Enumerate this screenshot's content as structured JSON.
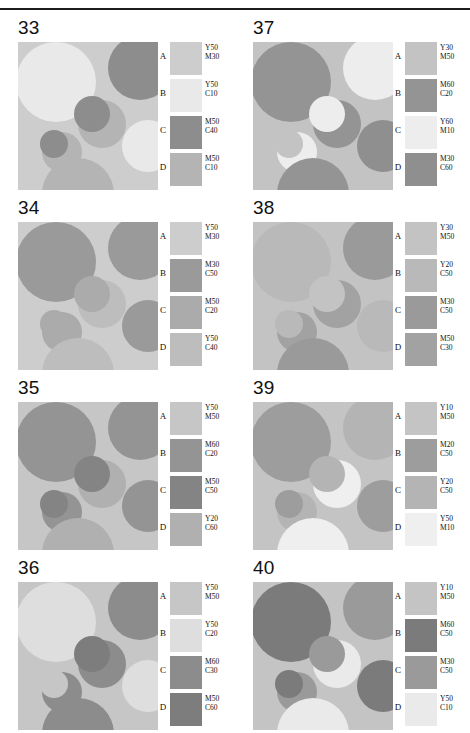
{
  "document": {
    "type": "color-specification-chart",
    "ink_notation": "CMY percentages (C=cyan, M=magenta, Y=yellow)",
    "swatch_letters": [
      "A",
      "B",
      "C",
      "D"
    ]
  },
  "panels": [
    {
      "number": "33",
      "swatches": [
        {
          "letter": "A",
          "line1": "Y50",
          "line2": "M30",
          "hex": "#cdcdcd"
        },
        {
          "letter": "B",
          "line1": "Y50",
          "line2": "C10",
          "hex": "#e9e9e9"
        },
        {
          "letter": "C",
          "line1": "M50",
          "line2": "C40",
          "hex": "#8d8d8d"
        },
        {
          "letter": "D",
          "line1": "M50",
          "line2": "C10",
          "hex": "#b4b4b4"
        }
      ],
      "art": {
        "background": "#cdcdcd",
        "circles": [
          {
            "cx": 38,
            "cy": 40,
            "r": 40,
            "fill": "#e9e9e9"
          },
          {
            "cx": 122,
            "cy": 26,
            "r": 32,
            "fill": "#8d8d8d"
          },
          {
            "cx": 84,
            "cy": 82,
            "r": 24,
            "fill": "#b4b4b4"
          },
          {
            "cx": 130,
            "cy": 104,
            "r": 26,
            "fill": "#e9e9e9"
          },
          {
            "cx": 44,
            "cy": 110,
            "r": 20,
            "fill": "#b4b4b4"
          },
          {
            "cx": 60,
            "cy": 152,
            "r": 36,
            "fill": "#b4b4b4"
          },
          {
            "cx": 74,
            "cy": 72,
            "r": 18,
            "fill": "#8d8d8d"
          },
          {
            "cx": 36,
            "cy": 102,
            "r": 14,
            "fill": "#8d8d8d"
          }
        ]
      }
    },
    {
      "number": "37",
      "swatches": [
        {
          "letter": "A",
          "line1": "Y30",
          "line2": "M50",
          "hex": "#c3c3c3"
        },
        {
          "letter": "B",
          "line1": "M60",
          "line2": "C20",
          "hex": "#949494"
        },
        {
          "letter": "C",
          "line1": "Y60",
          "line2": "M10",
          "hex": "#ededed"
        },
        {
          "letter": "D",
          "line1": "M30",
          "line2": "C60",
          "hex": "#8f8f8f"
        }
      ],
      "art": {
        "background": "#c3c3c3",
        "circles": [
          {
            "cx": 38,
            "cy": 40,
            "r": 40,
            "fill": "#949494"
          },
          {
            "cx": 122,
            "cy": 26,
            "r": 32,
            "fill": "#ededed"
          },
          {
            "cx": 84,
            "cy": 82,
            "r": 24,
            "fill": "#949494"
          },
          {
            "cx": 130,
            "cy": 104,
            "r": 26,
            "fill": "#8f8f8f"
          },
          {
            "cx": 44,
            "cy": 110,
            "r": 20,
            "fill": "#ededed"
          },
          {
            "cx": 60,
            "cy": 152,
            "r": 36,
            "fill": "#949494"
          },
          {
            "cx": 74,
            "cy": 72,
            "r": 18,
            "fill": "#ededed"
          },
          {
            "cx": 36,
            "cy": 102,
            "r": 14,
            "fill": "#c3c3c3"
          }
        ]
      }
    },
    {
      "number": "34",
      "swatches": [
        {
          "letter": "A",
          "line1": "Y50",
          "line2": "M30",
          "hex": "#cdcdcd"
        },
        {
          "letter": "B",
          "line1": "M30",
          "line2": "C50",
          "hex": "#9a9a9a"
        },
        {
          "letter": "C",
          "line1": "M50",
          "line2": "C20",
          "hex": "#ababab"
        },
        {
          "letter": "D",
          "line1": "Y50",
          "line2": "C40",
          "hex": "#bdbdbd"
        }
      ],
      "art": {
        "background": "#cdcdcd",
        "circles": [
          {
            "cx": 38,
            "cy": 40,
            "r": 40,
            "fill": "#9a9a9a"
          },
          {
            "cx": 122,
            "cy": 26,
            "r": 32,
            "fill": "#9a9a9a"
          },
          {
            "cx": 84,
            "cy": 82,
            "r": 24,
            "fill": "#bdbdbd"
          },
          {
            "cx": 130,
            "cy": 104,
            "r": 26,
            "fill": "#9a9a9a"
          },
          {
            "cx": 44,
            "cy": 110,
            "r": 20,
            "fill": "#ababab"
          },
          {
            "cx": 60,
            "cy": 152,
            "r": 36,
            "fill": "#bdbdbd"
          },
          {
            "cx": 74,
            "cy": 72,
            "r": 18,
            "fill": "#ababab"
          },
          {
            "cx": 36,
            "cy": 102,
            "r": 14,
            "fill": "#ababab"
          }
        ]
      }
    },
    {
      "number": "38",
      "swatches": [
        {
          "letter": "A",
          "line1": "Y30",
          "line2": "M50",
          "hex": "#c3c3c3"
        },
        {
          "letter": "B",
          "line1": "Y20",
          "line2": "C50",
          "hex": "#b9b9b9"
        },
        {
          "letter": "C",
          "line1": "M30",
          "line2": "C50",
          "hex": "#9a9a9a"
        },
        {
          "letter": "D",
          "line1": "M50",
          "line2": "C30",
          "hex": "#a2a2a2"
        }
      ],
      "art": {
        "background": "#c3c3c3",
        "circles": [
          {
            "cx": 38,
            "cy": 40,
            "r": 40,
            "fill": "#b9b9b9"
          },
          {
            "cx": 122,
            "cy": 26,
            "r": 32,
            "fill": "#9a9a9a"
          },
          {
            "cx": 84,
            "cy": 82,
            "r": 24,
            "fill": "#a2a2a2"
          },
          {
            "cx": 130,
            "cy": 104,
            "r": 26,
            "fill": "#b9b9b9"
          },
          {
            "cx": 44,
            "cy": 110,
            "r": 20,
            "fill": "#a2a2a2"
          },
          {
            "cx": 60,
            "cy": 152,
            "r": 36,
            "fill": "#9a9a9a"
          },
          {
            "cx": 74,
            "cy": 72,
            "r": 18,
            "fill": "#c3c3c3"
          },
          {
            "cx": 36,
            "cy": 102,
            "r": 14,
            "fill": "#b9b9b9"
          }
        ]
      }
    },
    {
      "number": "35",
      "swatches": [
        {
          "letter": "A",
          "line1": "Y50",
          "line2": "M50",
          "hex": "#c6c6c6"
        },
        {
          "letter": "B",
          "line1": "M60",
          "line2": "C20",
          "hex": "#949494"
        },
        {
          "letter": "C",
          "line1": "M50",
          "line2": "C50",
          "hex": "#848484"
        },
        {
          "letter": "D",
          "line1": "Y20",
          "line2": "C60",
          "hex": "#b0b0b0"
        }
      ],
      "art": {
        "background": "#c6c6c6",
        "circles": [
          {
            "cx": 38,
            "cy": 40,
            "r": 40,
            "fill": "#949494"
          },
          {
            "cx": 122,
            "cy": 26,
            "r": 32,
            "fill": "#949494"
          },
          {
            "cx": 84,
            "cy": 82,
            "r": 24,
            "fill": "#b0b0b0"
          },
          {
            "cx": 130,
            "cy": 104,
            "r": 26,
            "fill": "#949494"
          },
          {
            "cx": 44,
            "cy": 110,
            "r": 20,
            "fill": "#949494"
          },
          {
            "cx": 60,
            "cy": 152,
            "r": 36,
            "fill": "#b0b0b0"
          },
          {
            "cx": 74,
            "cy": 72,
            "r": 18,
            "fill": "#848484"
          },
          {
            "cx": 36,
            "cy": 102,
            "r": 14,
            "fill": "#848484"
          }
        ]
      }
    },
    {
      "number": "39",
      "swatches": [
        {
          "letter": "A",
          "line1": "Y10",
          "line2": "M50",
          "hex": "#c4c4c4"
        },
        {
          "letter": "B",
          "line1": "M20",
          "line2": "C50",
          "hex": "#9d9d9d"
        },
        {
          "letter": "C",
          "line1": "Y20",
          "line2": "C50",
          "hex": "#b4b4b4"
        },
        {
          "letter": "D",
          "line1": "Y50",
          "line2": "M10",
          "hex": "#efefef"
        }
      ],
      "art": {
        "background": "#c4c4c4",
        "circles": [
          {
            "cx": 38,
            "cy": 40,
            "r": 40,
            "fill": "#9d9d9d"
          },
          {
            "cx": 122,
            "cy": 26,
            "r": 32,
            "fill": "#b4b4b4"
          },
          {
            "cx": 84,
            "cy": 82,
            "r": 24,
            "fill": "#efefef"
          },
          {
            "cx": 130,
            "cy": 104,
            "r": 26,
            "fill": "#9d9d9d"
          },
          {
            "cx": 44,
            "cy": 110,
            "r": 20,
            "fill": "#b4b4b4"
          },
          {
            "cx": 60,
            "cy": 152,
            "r": 36,
            "fill": "#efefef"
          },
          {
            "cx": 74,
            "cy": 72,
            "r": 18,
            "fill": "#b4b4b4"
          },
          {
            "cx": 36,
            "cy": 102,
            "r": 14,
            "fill": "#9d9d9d"
          }
        ]
      }
    },
    {
      "number": "36",
      "swatches": [
        {
          "letter": "A",
          "line1": "Y50",
          "line2": "M50",
          "hex": "#c6c6c6"
        },
        {
          "letter": "B",
          "line1": "Y50",
          "line2": "C20",
          "hex": "#dedede"
        },
        {
          "letter": "C",
          "line1": "M60",
          "line2": "C30",
          "hex": "#8c8c8c"
        },
        {
          "letter": "D",
          "line1": "M50",
          "line2": "C60",
          "hex": "#7d7d7d"
        }
      ],
      "art": {
        "background": "#c6c6c6",
        "circles": [
          {
            "cx": 38,
            "cy": 40,
            "r": 40,
            "fill": "#dedede"
          },
          {
            "cx": 122,
            "cy": 26,
            "r": 32,
            "fill": "#8c8c8c"
          },
          {
            "cx": 84,
            "cy": 82,
            "r": 24,
            "fill": "#8c8c8c"
          },
          {
            "cx": 130,
            "cy": 104,
            "r": 26,
            "fill": "#dedede"
          },
          {
            "cx": 44,
            "cy": 110,
            "r": 20,
            "fill": "#8c8c8c"
          },
          {
            "cx": 60,
            "cy": 152,
            "r": 36,
            "fill": "#8c8c8c"
          },
          {
            "cx": 74,
            "cy": 72,
            "r": 18,
            "fill": "#7d7d7d"
          },
          {
            "cx": 36,
            "cy": 102,
            "r": 14,
            "fill": "#c6c6c6"
          }
        ]
      }
    },
    {
      "number": "40",
      "swatches": [
        {
          "letter": "A",
          "line1": "Y10",
          "line2": "M50",
          "hex": "#c4c4c4"
        },
        {
          "letter": "B",
          "line1": "M60",
          "line2": "C50",
          "hex": "#7b7b7b"
        },
        {
          "letter": "C",
          "line1": "M30",
          "line2": "C50",
          "hex": "#9a9a9a"
        },
        {
          "letter": "D",
          "line1": "Y50",
          "line2": "C10",
          "hex": "#eaeaea"
        }
      ],
      "art": {
        "background": "#c4c4c4",
        "circles": [
          {
            "cx": 38,
            "cy": 40,
            "r": 40,
            "fill": "#7b7b7b"
          },
          {
            "cx": 122,
            "cy": 26,
            "r": 32,
            "fill": "#9a9a9a"
          },
          {
            "cx": 84,
            "cy": 82,
            "r": 24,
            "fill": "#eaeaea"
          },
          {
            "cx": 130,
            "cy": 104,
            "r": 26,
            "fill": "#7b7b7b"
          },
          {
            "cx": 44,
            "cy": 110,
            "r": 20,
            "fill": "#9a9a9a"
          },
          {
            "cx": 60,
            "cy": 152,
            "r": 36,
            "fill": "#eaeaea"
          },
          {
            "cx": 74,
            "cy": 72,
            "r": 18,
            "fill": "#9a9a9a"
          },
          {
            "cx": 36,
            "cy": 102,
            "r": 14,
            "fill": "#7b7b7b"
          }
        ]
      }
    }
  ]
}
